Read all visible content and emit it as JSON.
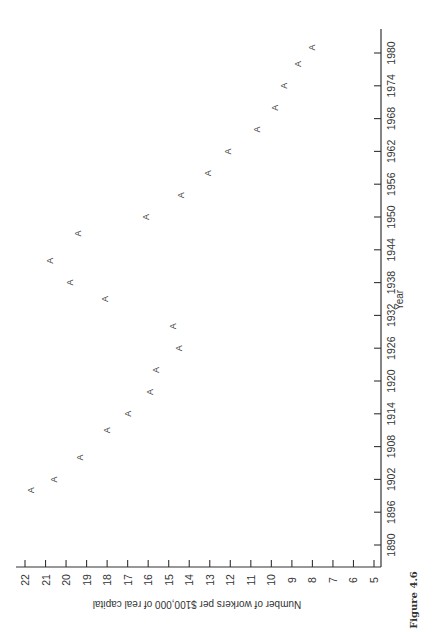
{
  "chart_data": {
    "type": "scatter",
    "orientation": "rotated-90-clockwise",
    "marker": "A",
    "title": "",
    "caption": "Figure 4.6",
    "xlabel": "Year",
    "ylabel": "Number of workers per $100,000 of real capital",
    "xlim": [
      1890,
      1980
    ],
    "ylim": [
      5,
      22
    ],
    "xticks": [
      "1890",
      "1896",
      "1902",
      "1908",
      "1914",
      "1920",
      "1926",
      "1932",
      "1938",
      "1944",
      "1950",
      "1956",
      "1962",
      "1968",
      "1974",
      "1980"
    ],
    "yticks": [
      "5",
      "6",
      "7",
      "8",
      "9",
      "10",
      "11",
      "12",
      "13",
      "14",
      "15",
      "16",
      "17",
      "18",
      "19",
      "20",
      "21",
      "22"
    ],
    "grid": false,
    "legend": "none",
    "series": [
      {
        "name": "A",
        "points": [
          {
            "x": 1900,
            "y": 21.7
          },
          {
            "x": 1902,
            "y": 20.6
          },
          {
            "x": 1906,
            "y": 19.3
          },
          {
            "x": 1911,
            "y": 18.0
          },
          {
            "x": 1914,
            "y": 17.0
          },
          {
            "x": 1918,
            "y": 15.9
          },
          {
            "x": 1922,
            "y": 15.6
          },
          {
            "x": 1926,
            "y": 14.5
          },
          {
            "x": 1930,
            "y": 14.8
          },
          {
            "x": 1935,
            "y": 18.1
          },
          {
            "x": 1938,
            "y": 19.8
          },
          {
            "x": 1942,
            "y": 20.8
          },
          {
            "x": 1947,
            "y": 19.4
          },
          {
            "x": 1950,
            "y": 16.1
          },
          {
            "x": 1954,
            "y": 14.4
          },
          {
            "x": 1958,
            "y": 13.1
          },
          {
            "x": 1962,
            "y": 12.1
          },
          {
            "x": 1966,
            "y": 10.7
          },
          {
            "x": 1970,
            "y": 9.8
          },
          {
            "x": 1974,
            "y": 9.4
          },
          {
            "x": 1978,
            "y": 8.7
          },
          {
            "x": 1981,
            "y": 8.0
          }
        ]
      }
    ]
  }
}
